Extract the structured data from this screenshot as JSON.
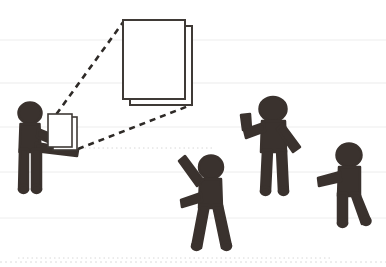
{
  "canvas": {
    "width": 386,
    "height": 267,
    "background_color": "#ffffff",
    "title": "Stick figure presenter showing an enlarged document to an audience"
  },
  "palette": {
    "figure_color": "#3a322e",
    "paper_fill": "#ffffff",
    "paper_stroke": "#3f3a36",
    "dashed_line_color": "#2e2a27",
    "ruled_line_color": "#e9e9e9",
    "dotted_line_color": "#d8d8d8"
  },
  "background": {
    "ruled_lines": [
      {
        "name": "ruled-line-1",
        "y": 40,
        "style": "solid",
        "color": "#ededed",
        "width": 1
      },
      {
        "name": "ruled-line-2",
        "y": 83,
        "style": "solid",
        "color": "#ebebeb",
        "width": 1
      },
      {
        "name": "ruled-line-3",
        "y": 127,
        "style": "solid",
        "color": "#ededed",
        "width": 1
      },
      {
        "name": "ruled-line-4",
        "y": 172,
        "style": "solid",
        "color": "#ececec",
        "width": 1
      },
      {
        "name": "ruled-line-5",
        "y": 218,
        "style": "solid",
        "color": "#eeeeee",
        "width": 1
      },
      {
        "name": "ruled-line-6",
        "y": 262,
        "style": "dotted",
        "color": "#dcdcdc",
        "width": 1
      }
    ],
    "faint_dotted_marks": [
      {
        "name": "dotted-mark-left",
        "y": 148,
        "x1": 80,
        "x2": 215
      },
      {
        "name": "dotted-mark-bottom",
        "y": 258,
        "x1": 18,
        "x2": 330
      }
    ]
  },
  "documents": {
    "large_document": {
      "label": "enlarged-document",
      "back_sheet": {
        "x": 130,
        "y": 26,
        "width": 62,
        "height": 79
      },
      "front_sheet": {
        "x": 123,
        "y": 20,
        "width": 62,
        "height": 79
      }
    },
    "held_document": {
      "label": "held-document",
      "back_sheet": {
        "x": 53,
        "y": 117,
        "width": 24,
        "height": 33
      },
      "front_sheet": {
        "x": 48,
        "y": 114,
        "width": 24,
        "height": 33
      }
    }
  },
  "projection_lines": [
    {
      "name": "projection-line-upper",
      "x1": 50,
      "y1": 123,
      "x2": 124,
      "y2": 21
    },
    {
      "name": "projection-line-lower",
      "x1": 78,
      "y1": 149,
      "x2": 191,
      "y2": 105
    }
  ],
  "figures": [
    {
      "name": "presenter-figure",
      "role": "presenter",
      "description": "stick figure holding a document with both hands",
      "head_center": {
        "x": 30,
        "y": 113
      },
      "head_radius": 11,
      "bounds": {
        "x": 14,
        "y": 102,
        "width": 62,
        "height": 88
      }
    },
    {
      "name": "audience-figure-waving-front",
      "role": "audience",
      "description": "stick figure with one arm raised diagonally and one arm lowered, legs striding",
      "head_center": {
        "x": 211,
        "y": 167
      },
      "head_radius": 12,
      "bounds": {
        "x": 180,
        "y": 152,
        "width": 52,
        "height": 98
      }
    },
    {
      "name": "audience-figure-waving-tall",
      "role": "audience",
      "description": "tall stick figure with bent raised arm and one arm angled down",
      "head_center": {
        "x": 273,
        "y": 109
      },
      "head_radius": 13,
      "bounds": {
        "x": 238,
        "y": 93,
        "width": 63,
        "height": 101
      }
    },
    {
      "name": "audience-figure-right",
      "role": "audience",
      "description": "stick figure with one arm extended horizontally, legs striding",
      "head_center": {
        "x": 349,
        "y": 155
      },
      "head_radius": 12,
      "bounds": {
        "x": 316,
        "y": 140,
        "width": 50,
        "height": 86
      }
    }
  ]
}
